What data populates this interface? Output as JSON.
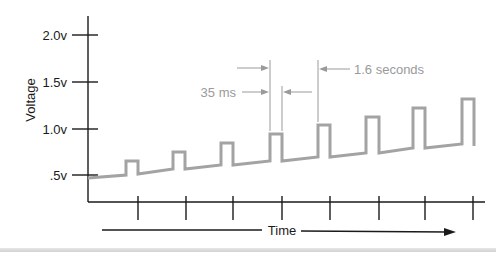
{
  "title": "",
  "y_axis": {
    "label": "Voltage",
    "ticks": [
      {
        "label": "2.0v",
        "y": 35
      },
      {
        "label": "1.5v",
        "y": 82
      },
      {
        "label": "1.0v",
        "y": 129
      },
      {
        "label": ".5v",
        "y": 175
      }
    ]
  },
  "x_axis": {
    "label": "Time",
    "tick_x": [
      138,
      186,
      233,
      282,
      330,
      379,
      425,
      473
    ]
  },
  "annotations": {
    "pulse_width": "35 ms",
    "pulse_interval": "1.6 seconds"
  },
  "colors": {
    "axis": "#1a1a1a",
    "waveform": "#a3a3a3",
    "annotation": "#9a9a9a"
  },
  "chart_data": {
    "type": "line",
    "title": "",
    "xlabel": "Time",
    "ylabel": "Voltage",
    "y_ticks": [
      ".5v",
      "1.0v",
      "1.5v",
      "2.0v"
    ],
    "ylim": [
      0.0,
      2.0
    ],
    "grid": false,
    "legend": null,
    "pulse_width": "35 ms",
    "pulse_period": "1.6 seconds",
    "series": [
      {
        "name": "waveform",
        "pulse_peaks_v": [
          0.56,
          0.66,
          0.75,
          0.85,
          0.95,
          1.04,
          1.14,
          1.23
        ],
        "baseline_start_v": 0.36,
        "baseline_end_v": 0.74
      }
    ],
    "waveform_points": [
      [
        88,
        178
      ],
      [
        126,
        175
      ],
      [
        126,
        161
      ],
      [
        138,
        161
      ],
      [
        138,
        174
      ],
      [
        173,
        169
      ],
      [
        173,
        152
      ],
      [
        185,
        152
      ],
      [
        185,
        169
      ],
      [
        221,
        165
      ],
      [
        221,
        143
      ],
      [
        233,
        143
      ],
      [
        233,
        165
      ],
      [
        270,
        161
      ],
      [
        270,
        134
      ],
      [
        282,
        134
      ],
      [
        282,
        161
      ],
      [
        318,
        157
      ],
      [
        318,
        125
      ],
      [
        330,
        125
      ],
      [
        330,
        157
      ],
      [
        366,
        153
      ],
      [
        366,
        117
      ],
      [
        379,
        117
      ],
      [
        379,
        153
      ],
      [
        413,
        148
      ],
      [
        413,
        108
      ],
      [
        425,
        108
      ],
      [
        425,
        148
      ],
      [
        462,
        144
      ],
      [
        462,
        99
      ],
      [
        474,
        99
      ],
      [
        474,
        146
      ]
    ]
  }
}
